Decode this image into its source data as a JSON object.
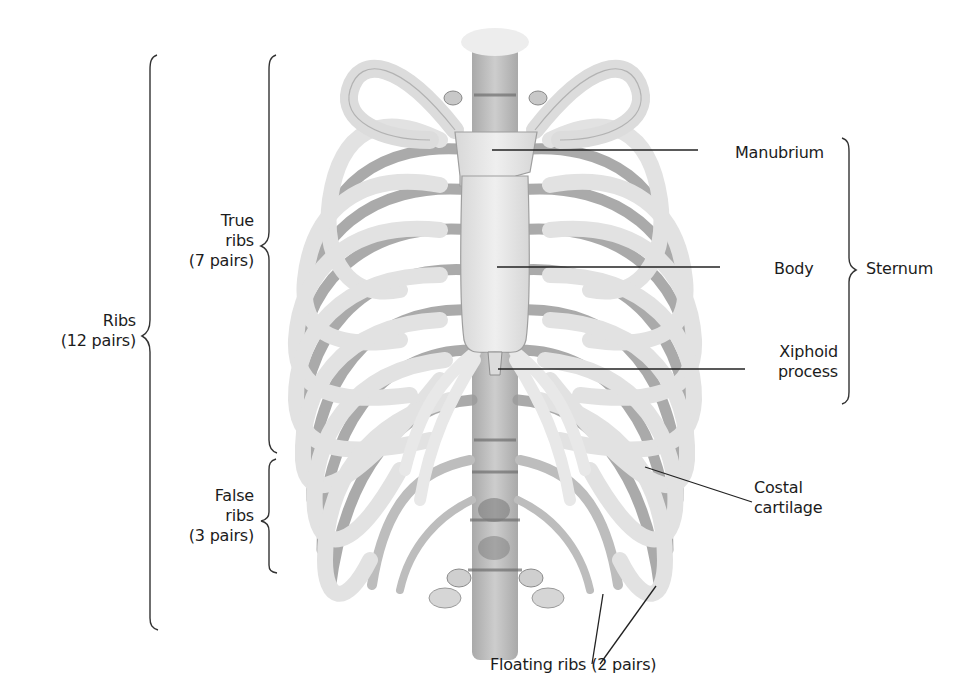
{
  "figure": {
    "colors": {
      "background": "#ffffff",
      "bone_light": "#e6e6e6",
      "bone_mid": "#c9c9c9",
      "bone_dark": "#8f8f8f",
      "line": "#222222",
      "text": "#1c1c1c"
    }
  },
  "labels": {
    "ribs": {
      "line1": "Ribs",
      "line2": "(12 pairs)"
    },
    "true_ribs": {
      "line1": "True",
      "line2": "ribs",
      "line3": "(7 pairs)"
    },
    "false_ribs": {
      "line1": "False",
      "line2": "ribs",
      "line3": "(3 pairs)"
    },
    "manubrium": "Manubrium",
    "body": "Body",
    "xiphoid": {
      "line1": "Xiphoid",
      "line2": "process"
    },
    "sternum": "Sternum",
    "costal_cartilage": {
      "line1": "Costal",
      "line2": "cartilage"
    },
    "floating_ribs": "Floating ribs (2 pairs)"
  }
}
